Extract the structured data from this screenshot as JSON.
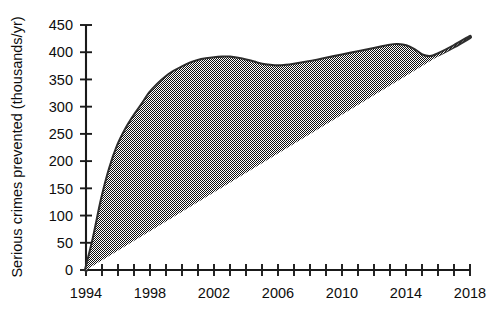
{
  "chart_data": {
    "type": "line",
    "title": "",
    "xlabel": "",
    "ylabel": "Serious crimes prevented (thousands/yr)",
    "xlim": [
      1994,
      2018
    ],
    "ylim": [
      0,
      450
    ],
    "grid": false,
    "legend": "none",
    "x_tick_interval": 1,
    "x_labeled_interval": 4,
    "y_tick_interval": 50,
    "xticks": [
      1994,
      1995,
      1996,
      1997,
      1998,
      1999,
      2000,
      2001,
      2002,
      2003,
      2004,
      2005,
      2006,
      2007,
      2008,
      2009,
      2010,
      2011,
      2012,
      2013,
      2014,
      2015,
      2016,
      2017,
      2018
    ],
    "xtick_labels": [
      "1994",
      "",
      "",
      "",
      "1998",
      "",
      "",
      "",
      "2002",
      "",
      "",
      "",
      "2006",
      "",
      "",
      "",
      "2010",
      "",
      "",
      "",
      "2014",
      "",
      "",
      "",
      "2018"
    ],
    "yticks": [
      0,
      50,
      100,
      150,
      200,
      250,
      300,
      350,
      400,
      450
    ],
    "ytick_labels": [
      "0",
      "50",
      "100",
      "150",
      "200",
      "250",
      "300",
      "350",
      "400",
      "450"
    ],
    "series": [
      {
        "name": "Serious crimes prevented",
        "color": "#2e2e2e",
        "x": [
          1994,
          1994.5,
          1995,
          1995.5,
          1996,
          1996.5,
          1997,
          1997.5,
          1998,
          1998.5,
          1999,
          1999.5,
          2000,
          2000.5,
          2001,
          2001.5,
          2002,
          2002.5,
          2003,
          2003.5,
          2004,
          2004.5,
          2005,
          2005.5,
          2006,
          2006.5,
          2007,
          2008,
          2009,
          2010,
          2011,
          2012,
          2013,
          2013.5,
          2014,
          2014.5,
          2015,
          2015.5,
          2016,
          2017,
          2018
        ],
        "y": [
          0,
          60,
          130,
          186,
          228,
          258,
          282,
          303,
          325,
          341,
          354,
          364,
          372,
          379,
          384,
          387,
          389,
          390,
          390,
          388,
          385,
          381,
          377,
          375,
          374,
          375,
          377,
          382,
          388,
          394,
          400,
          406,
          412,
          413,
          411,
          404,
          394,
          391,
          396,
          411,
          428
        ]
      }
    ],
    "annotations": []
  },
  "figure": {
    "background_color": "#ffffff",
    "axis_color": "#1a1a1a",
    "line_color": "#2e2e2e"
  }
}
